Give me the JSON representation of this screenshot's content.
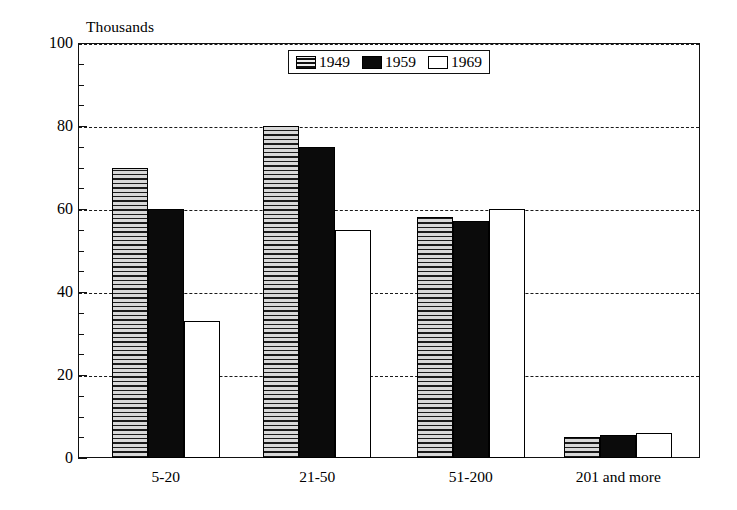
{
  "chart_data": {
    "type": "bar",
    "title": "",
    "subtitle": "",
    "unit_label": "Thousands",
    "xlabel": "",
    "ylabel": "",
    "ylim": [
      0,
      100
    ],
    "y_major_ticks": [
      0,
      20,
      40,
      60,
      80,
      100
    ],
    "y_minor_tick_step": 5,
    "y_tick_labels": [
      "0",
      "20",
      "40",
      "60",
      "80",
      "100"
    ],
    "grid": true,
    "grid_axis": "y",
    "grid_style": "dashed",
    "legend_position": "top-center-inside",
    "categories": [
      "5-20",
      "21-50",
      "51-200",
      "201 and more"
    ],
    "series": [
      {
        "name": "1949",
        "fill": "horizontal-hatch",
        "color": "#b9b9b9",
        "values": [
          70,
          80,
          58,
          5
        ]
      },
      {
        "name": "1959",
        "fill": "solid",
        "color": "#0b0b0b",
        "values": [
          60,
          75,
          57,
          5.5
        ]
      },
      {
        "name": "1969",
        "fill": "empty",
        "color": "#ffffff",
        "values": [
          33,
          55,
          60,
          6
        ]
      }
    ]
  },
  "legend": {
    "entries": [
      {
        "label": "1949"
      },
      {
        "label": "1959"
      },
      {
        "label": "1969"
      }
    ]
  },
  "colors": {
    "axis": "#111111",
    "grid": "#1a1a1a",
    "background": "#ffffff",
    "series_1949": "#b9b9b9",
    "series_1959": "#0b0b0b",
    "series_1969": "#ffffff"
  }
}
